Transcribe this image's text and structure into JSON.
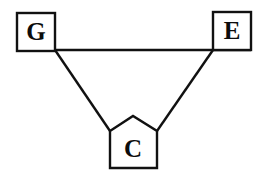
{
  "diagram": {
    "type": "node-link-graph",
    "title": "",
    "canvas": {
      "width": 263,
      "height": 179,
      "background": "#ffffff"
    },
    "style": {
      "stroke_color": "#111111",
      "fill_color": "#ffffff",
      "label_color": "#0c0c0c",
      "stroke_width": 2.4
    },
    "nodes": [
      {
        "id": "G",
        "label": "G",
        "shape": "square",
        "position": "top-left",
        "box": {
          "x": 17,
          "y": 13,
          "width": 38,
          "height": 38
        },
        "label_x": 36,
        "label_y": 33
      },
      {
        "id": "E",
        "label": "E",
        "shape": "square",
        "position": "top-right",
        "box": {
          "x": 213,
          "y": 12,
          "width": 38,
          "height": 38
        },
        "label_x": 232,
        "label_y": 32
      },
      {
        "id": "C",
        "label": "C",
        "shape": "pentagon",
        "position": "bottom-center",
        "points": "110,131 133,116 157,131 157,168 110,168",
        "label_x": 133,
        "label_y": 150
      }
    ],
    "edges": [
      {
        "id": "G-E",
        "from": "G",
        "to": "E",
        "kind": "horizontal",
        "x1": 17,
        "y1": 50,
        "x2": 251,
        "y2": 50
      },
      {
        "id": "G-C",
        "from": "G",
        "to": "C",
        "kind": "diagonal",
        "x1": 55,
        "y1": 50,
        "x2": 110,
        "y2": 131
      },
      {
        "id": "E-C",
        "from": "E",
        "to": "C",
        "kind": "diagonal",
        "x1": 213,
        "y1": 50,
        "x2": 157,
        "y2": 131
      }
    ]
  }
}
